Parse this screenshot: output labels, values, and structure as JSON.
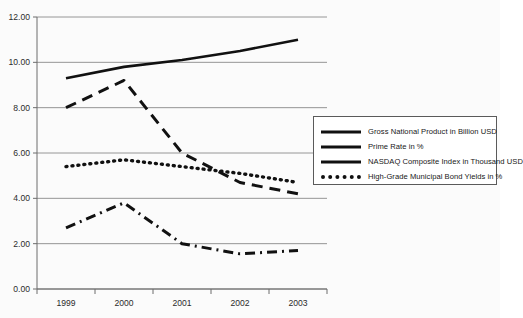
{
  "chart_data": {
    "type": "line",
    "title": "",
    "xlabel": "",
    "ylabel": "",
    "categories": [
      "1999",
      "2000",
      "2001",
      "2002",
      "2003"
    ],
    "x_tick_labels": [
      "1999",
      "2000",
      "2001",
      "2002",
      "2003"
    ],
    "y_tick_labels": [
      "0.00",
      "2.00",
      "4.00",
      "6.00",
      "8.00",
      "10.00",
      "12.00"
    ],
    "y_ticks": [
      0,
      2,
      4,
      6,
      8,
      10,
      12
    ],
    "ylim": [
      0,
      12
    ],
    "grid": "horizontal",
    "legend_position": "right",
    "series": [
      {
        "name": "Gross National Product in Billion USD",
        "style": "solid",
        "color": "#111111",
        "values": [
          9.3,
          9.8,
          10.1,
          10.5,
          11.0
        ]
      },
      {
        "name": "Prime Rate in %",
        "style": "dash-dot",
        "color": "#111111",
        "values": [
          2.7,
          3.8,
          2.0,
          1.55,
          1.7
        ]
      },
      {
        "name": "NASDAQ Composite Index in Thousand USD",
        "style": "dashed",
        "color": "#111111",
        "values": [
          8.0,
          9.2,
          6.0,
          4.7,
          4.2
        ]
      },
      {
        "name": "High-Grade Municipal Bond Yields in %",
        "style": "dotted",
        "color": "#111111",
        "values": [
          5.4,
          5.7,
          5.4,
          5.1,
          4.7
        ]
      }
    ]
  },
  "legend": {
    "entries": [
      {
        "label": "Gross National Product in Billion USD",
        "style": "solid"
      },
      {
        "label": "Prime Rate in %",
        "style": "solid"
      },
      {
        "label": "NASDAQ Composite Index in Thousand USD",
        "style": "solid"
      },
      {
        "label": "High-Grade Municipal Bond Yields in %",
        "style": "dotted"
      }
    ]
  }
}
